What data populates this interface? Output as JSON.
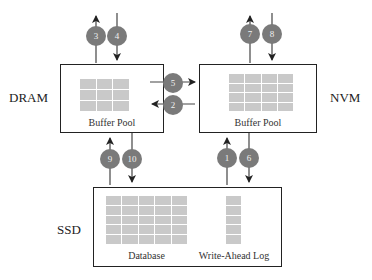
{
  "diagram": {
    "tiers": {
      "dram": {
        "label": "DRAM",
        "component": "Buffer Pool"
      },
      "nvm": {
        "label": "NVM",
        "component": "Buffer Pool"
      },
      "ssd": {
        "label": "SSD",
        "components": [
          "Database",
          "Write-Ahead Log"
        ]
      }
    },
    "steps": [
      {
        "id": "1",
        "from": "SSD Write-Ahead Log",
        "to": "NVM",
        "direction": "up"
      },
      {
        "id": "2",
        "from": "NVM",
        "to": "DRAM",
        "direction": "left"
      },
      {
        "id": "3",
        "from": "DRAM",
        "to": "outside",
        "direction": "up"
      },
      {
        "id": "4",
        "from": "outside",
        "to": "DRAM",
        "direction": "down"
      },
      {
        "id": "5",
        "from": "DRAM",
        "to": "NVM",
        "direction": "right"
      },
      {
        "id": "6",
        "from": "NVM",
        "to": "SSD Write-Ahead Log",
        "direction": "down"
      },
      {
        "id": "7",
        "from": "NVM",
        "to": "outside",
        "direction": "up"
      },
      {
        "id": "8",
        "from": "outside",
        "to": "NVM",
        "direction": "down"
      },
      {
        "id": "9",
        "from": "SSD Database",
        "to": "DRAM",
        "direction": "up"
      },
      {
        "id": "10",
        "from": "DRAM",
        "to": "SSD Database",
        "direction": "down"
      }
    ],
    "colors": {
      "badge": "#7a7a7a",
      "badge_text": "#f0f0f0",
      "grid_cell": "#c9c9c9",
      "line": "#222222"
    }
  }
}
